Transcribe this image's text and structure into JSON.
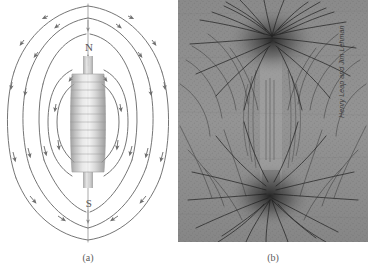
{
  "figure": {
    "background_color": "#ffffff",
    "panels": [
      {
        "id": "a",
        "caption": "(a)",
        "type": "line-diagram",
        "description": "Magnetic field lines around a bar magnet"
      },
      {
        "id": "b",
        "caption": "(b)",
        "type": "photograph",
        "description": "Iron filings pattern around a bar magnet"
      }
    ]
  },
  "panel_a": {
    "caption": "(a)",
    "north_pole_label": "N",
    "south_pole_label": "S",
    "magnet_color": "#b8b8b8",
    "field_line_color": "#6e6e6e",
    "field_line_count": 14,
    "arrowhead_count": 22
  },
  "panel_b": {
    "caption": "(b)",
    "credit": "Henry Leap and Jim Lehman",
    "photo_base_color": "#8f8f8f",
    "filing_color": "#1c1c1c"
  }
}
